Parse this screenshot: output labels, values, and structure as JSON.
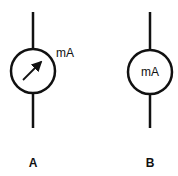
{
  "symbols": [
    {
      "id": "A",
      "label": "A",
      "unit": "mA",
      "type": "ammeter-with-needle"
    },
    {
      "id": "B",
      "label": "B",
      "unit": "mA",
      "type": "ammeter-text"
    }
  ],
  "colors": {
    "stroke": "#111111",
    "background": "#ffffff"
  }
}
